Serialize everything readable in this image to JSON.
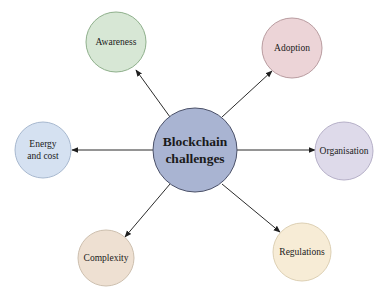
{
  "diagram": {
    "type": "hub-and-spoke",
    "center": {
      "lines": [
        "Blockchain",
        "challenges"
      ],
      "fill": "#a9b4d2",
      "stroke": "#4a5068"
    },
    "nodes": [
      {
        "id": "awareness",
        "lines": [
          "Awareness"
        ],
        "fill": "#d7e7d5",
        "stroke": "#8fb08c"
      },
      {
        "id": "adoption",
        "lines": [
          "Adoption"
        ],
        "fill": "#ecd4d7",
        "stroke": "#b99ca0"
      },
      {
        "id": "energy",
        "lines": [
          "Energy",
          "and cost"
        ],
        "fill": "#d5e1f1",
        "stroke": "#a7b8cf"
      },
      {
        "id": "organisation",
        "lines": [
          "Organisation"
        ],
        "fill": "#dedaea",
        "stroke": "#b6b0c8"
      },
      {
        "id": "complexity",
        "lines": [
          "Complexity"
        ],
        "fill": "#eee0d2",
        "stroke": "#cdbfae"
      },
      {
        "id": "regulations",
        "lines": [
          "Regulations"
        ],
        "fill": "#f7ecd6",
        "stroke": "#ddd0b4"
      }
    ],
    "edges": [
      {
        "from": "center",
        "to": "awareness",
        "arrow": "end"
      },
      {
        "from": "center",
        "to": "adoption",
        "arrow": "end"
      },
      {
        "from": "center",
        "to": "energy",
        "arrow": "end"
      },
      {
        "from": "center",
        "to": "organisation",
        "arrow": "end"
      },
      {
        "from": "center",
        "to": "complexity",
        "arrow": "end"
      },
      {
        "from": "center",
        "to": "regulations",
        "arrow": "end"
      }
    ]
  }
}
